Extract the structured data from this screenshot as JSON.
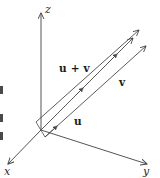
{
  "figure": {
    "kind": "vector-addition-3d-diagram",
    "background_color": "#ffffff",
    "line_color": "#4a4a4a",
    "text_color": "#1c1c1c",
    "axes": {
      "z": {
        "label": "z"
      },
      "x": {
        "label": "x"
      },
      "y": {
        "label": "y"
      }
    },
    "vectors": {
      "sum": {
        "label": "u + v"
      },
      "v": {
        "label": "v"
      },
      "u": {
        "label": "u"
      }
    }
  }
}
